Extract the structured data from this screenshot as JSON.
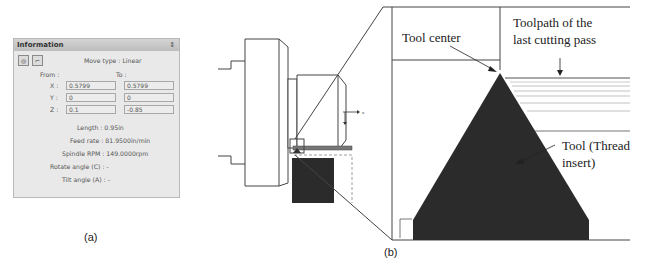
{
  "panel_a": {
    "title": "Information",
    "pin_icon": "pin-icon",
    "icons": [
      "simulate-icon",
      "toolpath-icon"
    ],
    "move_type": "Move type : Linear",
    "from_label": "From :",
    "to_label": "To :",
    "coords": [
      {
        "axis": "X :",
        "from": "0.5799",
        "to": "0.5799"
      },
      {
        "axis": "Y :",
        "from": "0",
        "to": "0"
      },
      {
        "axis": "Z :",
        "from": "0.1",
        "to": "-0.85"
      }
    ],
    "length": "Length : 0.95in",
    "feed_rate": "Feed rate : 81.9500in/min",
    "spindle_rpm": "Spindle RPM : 149.0000rpm",
    "rotate_angle": "Rotate angle (C) : -",
    "tilt_angle": "Tilt angle (A) : -",
    "caption": "(a)"
  },
  "panel_b": {
    "caption": "(b)",
    "labels": {
      "tool_center": "Tool center",
      "toolpath_line1": "Toolpath of the",
      "toolpath_line2": "last cutting pass",
      "tool_line1": "Tool (Thread",
      "tool_line2": "insert)"
    },
    "axis_label_z": "z",
    "axis_label_x": "x"
  }
}
